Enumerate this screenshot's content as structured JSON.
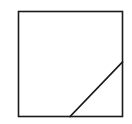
{
  "diagram": {
    "stroke_color": "#1a1a1a",
    "background_color": "#ffffff",
    "shapes": [
      {
        "id": "square",
        "kind": "square"
      },
      {
        "id": "corner-cut",
        "kind": "line",
        "from": "bottom-edge",
        "to": "right-edge"
      }
    ]
  }
}
